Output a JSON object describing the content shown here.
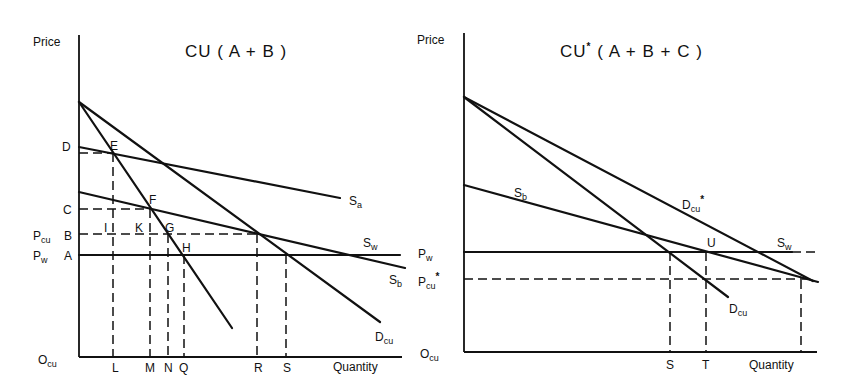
{
  "figure": {
    "background": "#ffffff",
    "ink": "#111111"
  },
  "chart_data": [
    {
      "type": "line",
      "name": "left-panel",
      "title": {
        "main": "CU ( A + B )",
        "x": 185,
        "y": 57
      },
      "ylabel": {
        "main": "Price",
        "x": 33,
        "y": 46
      },
      "xlabel": {
        "main": "Quantity",
        "x": 333,
        "y": 371
      },
      "origin_label": {
        "main": "O",
        "sub": "cu",
        "x": 38,
        "y": 364
      },
      "axes": {
        "origin": [
          79,
          357
        ],
        "y_top": 35,
        "x_right": 402
      },
      "curves": [
        {
          "name": "Dcu",
          "points": [
            [
              79,
              102
            ],
            [
              380,
              322
            ]
          ],
          "style": "curve"
        },
        {
          "name": "demand-steep",
          "points": [
            [
              79,
              102
            ],
            [
              232,
              328
            ]
          ],
          "style": "curve"
        },
        {
          "name": "Sa",
          "points": [
            [
              79,
              147
            ],
            [
              340,
              198
            ]
          ],
          "style": "curve"
        },
        {
          "name": "Sb",
          "points": [
            [
              79,
              192
            ],
            [
              405,
              268
            ]
          ],
          "style": "curve"
        },
        {
          "name": "Sw",
          "points": [
            [
              79,
              255
            ],
            [
              400,
              255
            ]
          ],
          "style": "curve"
        },
        {
          "name": "price-D-guide",
          "points": [
            [
              79,
              153
            ],
            [
              113,
              153
            ]
          ],
          "style": "guide"
        },
        {
          "name": "price-C-guide",
          "points": [
            [
              79,
              209
            ],
            [
              150,
              209
            ]
          ],
          "style": "guide"
        },
        {
          "name": "price-B-guide",
          "points": [
            [
              79,
              234
            ],
            [
              257,
              234
            ]
          ],
          "style": "guide"
        },
        {
          "name": "L-guide",
          "points": [
            [
              113,
              153
            ],
            [
              113,
              357
            ]
          ],
          "style": "guide"
        },
        {
          "name": "M-guide",
          "points": [
            [
              150,
              209
            ],
            [
              150,
              357
            ]
          ],
          "style": "guide"
        },
        {
          "name": "N-guide",
          "points": [
            [
              168,
              234
            ],
            [
              168,
              357
            ]
          ],
          "style": "guide"
        },
        {
          "name": "Q-guide",
          "points": [
            [
              184,
              255
            ],
            [
              184,
              357
            ]
          ],
          "style": "guide"
        },
        {
          "name": "R-guide",
          "points": [
            [
              257,
              234
            ],
            [
              257,
              357
            ]
          ],
          "style": "guide"
        },
        {
          "name": "S-guide",
          "points": [
            [
              286,
              255
            ],
            [
              286,
              357
            ]
          ],
          "style": "guide"
        }
      ],
      "labels": [
        {
          "id": "D",
          "main": "D",
          "x": 62,
          "y": 151
        },
        {
          "id": "C",
          "main": "C",
          "x": 63,
          "y": 214
        },
        {
          "id": "Pcu",
          "main": "P",
          "sub": "cu",
          "x": 33,
          "y": 240
        },
        {
          "id": "B",
          "main": "B",
          "x": 64,
          "y": 240
        },
        {
          "id": "Pw",
          "main": "P",
          "sub": "w",
          "x": 33,
          "y": 260
        },
        {
          "id": "A",
          "main": "A",
          "x": 64,
          "y": 260
        },
        {
          "id": "E",
          "main": "E",
          "x": 110,
          "y": 150
        },
        {
          "id": "F",
          "main": "F",
          "x": 149,
          "y": 204
        },
        {
          "id": "I",
          "main": "I",
          "x": 104,
          "y": 232
        },
        {
          "id": "K",
          "main": "K",
          "x": 135,
          "y": 232
        },
        {
          "id": "G",
          "main": "G",
          "x": 165,
          "y": 232
        },
        {
          "id": "H",
          "main": "H",
          "x": 182,
          "y": 252
        },
        {
          "id": "Sa",
          "main": "S",
          "sub": "a",
          "x": 349,
          "y": 205
        },
        {
          "id": "Sw",
          "main": "S",
          "sub": "w",
          "x": 363,
          "y": 247
        },
        {
          "id": "Sb",
          "main": "S",
          "sub": "b",
          "x": 389,
          "y": 284
        },
        {
          "id": "Dcu",
          "main": "D",
          "sub": "cu",
          "x": 375,
          "y": 341
        },
        {
          "id": "L",
          "main": "L",
          "x": 112,
          "y": 372
        },
        {
          "id": "M",
          "main": "M",
          "x": 145,
          "y": 372
        },
        {
          "id": "N",
          "main": "N",
          "x": 164,
          "y": 372
        },
        {
          "id": "Q",
          "main": "Q",
          "x": 179,
          "y": 372
        },
        {
          "id": "R",
          "main": "R",
          "x": 254,
          "y": 372
        },
        {
          "id": "S",
          "main": "S",
          "x": 283,
          "y": 372
        }
      ]
    },
    {
      "type": "line",
      "name": "right-panel",
      "title": {
        "main": "CU",
        "sup": "*",
        "rest": " ( A + B + C )",
        "x": 560,
        "y": 57
      },
      "ylabel": {
        "main": "Price",
        "x": 417,
        "y": 44
      },
      "xlabel": {
        "main": "Quantity",
        "x": 749,
        "y": 369
      },
      "origin_label": {
        "main": "O",
        "sub": "cu",
        "x": 420,
        "y": 358
      },
      "axes": {
        "origin": [
          464,
          352
        ],
        "y_top": 33,
        "x_right": 817
      },
      "curves": [
        {
          "name": "Dcu-star",
          "points": [
            [
              464,
              97
            ],
            [
              813,
              281
            ]
          ],
          "style": "curve"
        },
        {
          "name": "Dcu",
          "points": [
            [
              464,
              97
            ],
            [
              728,
              297
            ]
          ],
          "style": "curve"
        },
        {
          "name": "Sb",
          "points": [
            [
              464,
              185
            ],
            [
              818,
              282
            ]
          ],
          "style": "curve"
        },
        {
          "name": "Sw-solid",
          "points": [
            [
              464,
              252
            ],
            [
              792,
              252
            ]
          ],
          "style": "curve"
        },
        {
          "name": "Sw-dashed",
          "points": [
            [
              792,
              252
            ],
            [
              818,
              252
            ]
          ],
          "style": "guide"
        },
        {
          "name": "Pcu-star-guide",
          "points": [
            [
              464,
              279
            ],
            [
              812,
              279
            ]
          ],
          "style": "guide"
        },
        {
          "name": "S-guide",
          "points": [
            [
              670,
              252
            ],
            [
              670,
              352
            ]
          ],
          "style": "guide"
        },
        {
          "name": "T-guide",
          "points": [
            [
              706,
              252
            ],
            [
              706,
              352
            ]
          ],
          "style": "guide"
        },
        {
          "name": "end-guide",
          "points": [
            [
              801,
              280
            ],
            [
              801,
              352
            ]
          ],
          "style": "guide"
        }
      ],
      "labels": [
        {
          "id": "Pw",
          "main": "P",
          "sub": "w",
          "x": 418,
          "y": 258
        },
        {
          "id": "Pcu-star",
          "main": "P",
          "sub": "cu",
          "sup": "*",
          "x": 418,
          "y": 286
        },
        {
          "id": "Sb",
          "main": "S",
          "sub": "b",
          "x": 514,
          "y": 197
        },
        {
          "id": "Dcu-star",
          "main": "D",
          "sub": "cu",
          "sup": "*",
          "x": 682,
          "y": 209
        },
        {
          "id": "U",
          "main": "U",
          "x": 707,
          "y": 247
        },
        {
          "id": "Sw",
          "main": "S",
          "sub": "w",
          "x": 777,
          "y": 247
        },
        {
          "id": "Dcu",
          "main": "D",
          "sub": "cu",
          "x": 729,
          "y": 313
        },
        {
          "id": "S",
          "main": "S",
          "x": 666,
          "y": 369
        },
        {
          "id": "T",
          "main": "T",
          "x": 702,
          "y": 369
        }
      ]
    }
  ]
}
